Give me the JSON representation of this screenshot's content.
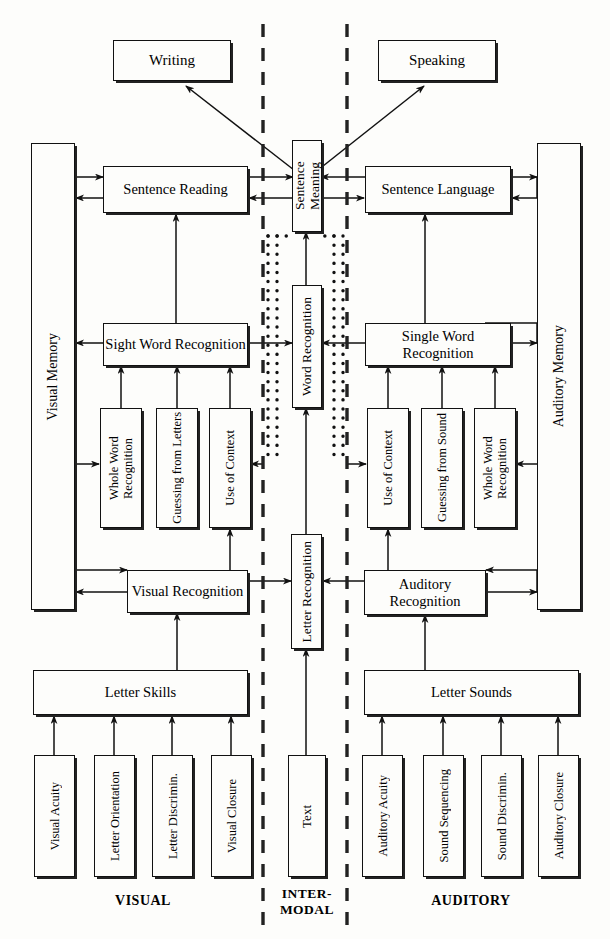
{
  "diagram": {
    "band_labels": {
      "visual": "VISUAL",
      "intermodal": "INTER-\nMODAL",
      "auditory": "AUDITORY"
    },
    "output_boxes": {
      "writing": "Writing",
      "speaking": "Speaking"
    },
    "memory_boxes": {
      "visual_memory": "Visual Memory",
      "auditory_memory": "Auditory Memory"
    },
    "sentence_level": {
      "sentence_reading": "Sentence Reading",
      "sentence_meaning": "Sentence Meaning",
      "sentence_language": "Sentence Language"
    },
    "word_level": {
      "sight_word_recognition": "Sight Word Recognition",
      "word_recognition": "Word Recognition",
      "single_word_recognition": "Single Word Recognition"
    },
    "visual_strategies": [
      "Whole Word Recognition",
      "Guessing from Letters",
      "Use of Context"
    ],
    "auditory_strategies": [
      "Use of Context",
      "Guessing from Sound",
      "Whole Word Recognition"
    ],
    "recognition_level": {
      "visual_recognition": "Visual Recognition",
      "letter_recognition": "Letter Recognition",
      "auditory_recognition": "Auditory Recognition"
    },
    "skills_level": {
      "letter_skills": "Letter Skills",
      "letter_sounds": "Letter Sounds"
    },
    "visual_primitives": [
      "Visual Acuity",
      "Letter Orientation",
      "Letter Discrimin.",
      "Visual Closure"
    ],
    "intermodal_primitive": "Text",
    "auditory_primitives": [
      "Auditory Acuity",
      "Sound Sequencing",
      "Sound Discrimin.",
      "Auditory Closure"
    ],
    "colors": {
      "ink": "#111111",
      "paper": "#fdfdfb"
    }
  }
}
